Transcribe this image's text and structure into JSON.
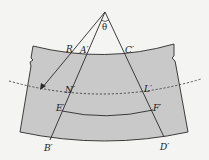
{
  "diagram": {
    "type": "optical-geometry",
    "colors": {
      "background": "#f4f4f2",
      "slab_fill": "#c9c9c9",
      "stroke": "#2a2a2a"
    },
    "labels": {
      "theta": "θ",
      "R": "R",
      "A_prime": "A′",
      "C_prime": "C′",
      "N_prime": "N′",
      "L_prime": "L′",
      "E_prime": "E′",
      "F_prime": "F′",
      "B_prime": "B′",
      "D_prime": "D′"
    }
  }
}
